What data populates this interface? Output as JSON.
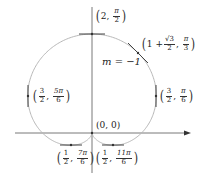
{
  "diagram": {
    "type": "polar cardioid with tangent lines",
    "curve": "r = 1 + sin(theta)",
    "colors": {
      "curve": "#b8b8b8",
      "axes": "#555555",
      "tangent": "#444444",
      "text": "#222222"
    },
    "origin_label": "(0, 0)",
    "slope_label": "m = −1",
    "points": [
      {
        "id": "top",
        "r_text": "2",
        "theta_num": "π",
        "theta_den": "2",
        "tangent": "horizontal"
      },
      {
        "id": "pi-over-3",
        "r_text": "1 + ",
        "r_num": "√3",
        "r_den": "2",
        "theta_num": "π",
        "theta_den": "3",
        "tangent": "slope -1"
      },
      {
        "id": "right",
        "r_num": "3",
        "r_den": "2",
        "theta_num": "π",
        "theta_den": "6",
        "tangent": "vertical"
      },
      {
        "id": "left",
        "r_num": "3",
        "r_den": "2",
        "theta_num": "5π",
        "theta_den": "6",
        "tangent": "vertical"
      },
      {
        "id": "lower-left",
        "r_num": "1",
        "r_den": "2",
        "theta_num": "7π",
        "theta_den": "6",
        "tangent": "horizontal"
      },
      {
        "id": "lower-right",
        "r_num": "1",
        "r_den": "2",
        "theta_num": "11π",
        "theta_den": "6",
        "tangent": "horizontal"
      }
    ]
  }
}
